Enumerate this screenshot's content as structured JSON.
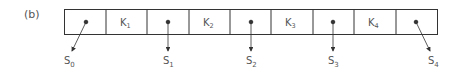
{
  "figure_label": "(b)",
  "node": {
    "cells": [
      {
        "type": "pointer",
        "target": "S0"
      },
      {
        "type": "key",
        "label": "K",
        "sub": "1"
      },
      {
        "type": "pointer",
        "target": "S1"
      },
      {
        "type": "key",
        "label": "K",
        "sub": "2"
      },
      {
        "type": "pointer",
        "target": "S2"
      },
      {
        "type": "key",
        "label": "K",
        "sub": "3"
      },
      {
        "type": "pointer",
        "target": "S3"
      },
      {
        "type": "key",
        "label": "K",
        "sub": "4"
      },
      {
        "type": "pointer",
        "target": "S4"
      }
    ]
  },
  "subtrees": [
    {
      "label": "S",
      "sub": "0"
    },
    {
      "label": "S",
      "sub": "1"
    },
    {
      "label": "S",
      "sub": "2"
    },
    {
      "label": "S",
      "sub": "3"
    },
    {
      "label": "S",
      "sub": "4"
    }
  ],
  "colors": {
    "stroke": "#333333",
    "text": "#555555"
  }
}
